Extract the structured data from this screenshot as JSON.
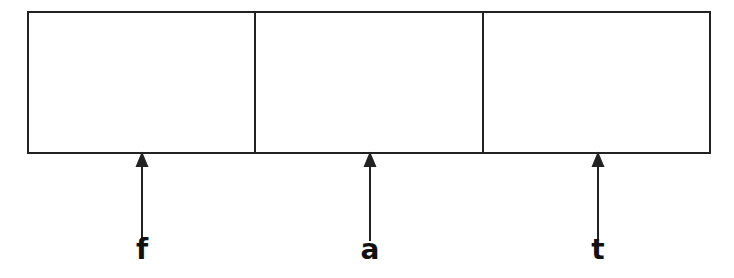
{
  "diagram": {
    "type": "array-with-pointers",
    "cells": [
      {
        "content": ""
      },
      {
        "content": ""
      },
      {
        "content": ""
      }
    ],
    "pointers": [
      {
        "label": "f",
        "x": 142
      },
      {
        "label": "a",
        "x": 370
      },
      {
        "label": "t",
        "x": 598
      }
    ],
    "stroke_color": "#222222"
  }
}
